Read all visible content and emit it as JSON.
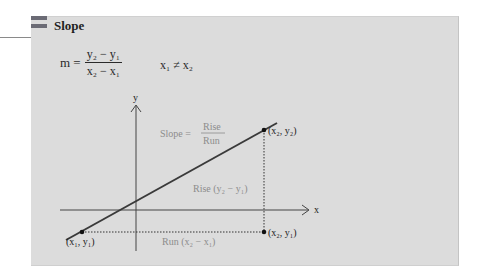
{
  "panel": {
    "title": "Slope",
    "icon": "double-bar-icon"
  },
  "formula": {
    "lhs": "m =",
    "numerator": "y₂ − y₁",
    "denominator": "x₂ − x₁",
    "condition": "x₁ ≠ x₂"
  },
  "diagram": {
    "axis_x_label": "x",
    "axis_y_label": "y",
    "slope_label": "Slope =",
    "slope_numerator": "Rise",
    "slope_denominator": "Run",
    "rise_label": "Rise (y₂ − y₁)",
    "run_label": "Run (x₂ − x₁)",
    "points": [
      {
        "label": "(x₁, y₁)"
      },
      {
        "label": "(x₂, y₂)"
      },
      {
        "label": "(x₂, y₁)"
      }
    ]
  },
  "colors": {
    "panel_bg": "#dcdcdc",
    "line": "#3a3a3a",
    "muted_text": "#8c8c8c"
  }
}
